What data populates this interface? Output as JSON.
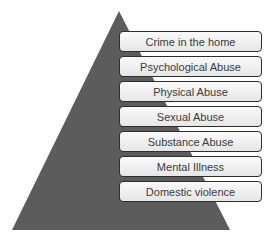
{
  "diagram": {
    "type": "pyramid",
    "colors": {
      "pyramid": "#5c5c5c",
      "box_border": "#2e2e2e",
      "box_fill": "#f0f0f0",
      "text": "#3a3a3a"
    },
    "levels": [
      {
        "label": "Crime in the home"
      },
      {
        "label": "Psychological Abuse"
      },
      {
        "label": "Physical Abuse"
      },
      {
        "label": "Sexual Abuse"
      },
      {
        "label": "Substance Abuse"
      },
      {
        "label": "Mental Illness"
      },
      {
        "label": "Domestic violence"
      }
    ]
  }
}
